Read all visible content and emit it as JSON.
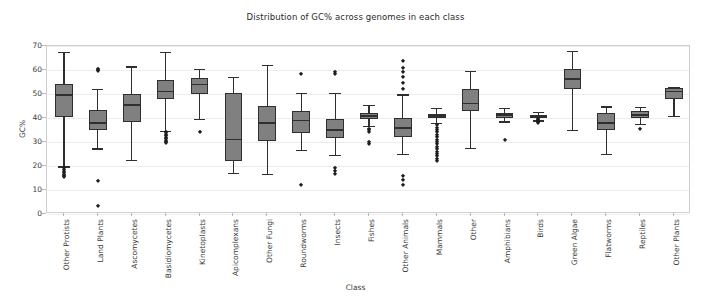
{
  "chart_data": {
    "type": "box",
    "title": "Distribution of GC% across genomes in each class",
    "xlabel": "Class",
    "ylabel": "GC%",
    "ylim": [
      0,
      70
    ],
    "yticks": [
      0,
      10,
      20,
      30,
      40,
      50,
      60,
      70
    ],
    "grid": true,
    "legend": "none",
    "box_facecolor": "#808080",
    "box_edgecolor": "#2f2f2f",
    "categories": [
      "Other Protists",
      "Land Plants",
      "Ascomycetes",
      "Basidiomycetes",
      "Kinetoplasts",
      "Apicomplexans",
      "Other Fungi",
      "Roundworms",
      "Insects",
      "Fishes",
      "Other Animals",
      "Mammals",
      "Other",
      "Amphibians",
      "Birds",
      "Green Algae",
      "Flatworms",
      "Reptiles",
      "Other Plants"
    ],
    "boxes": [
      {
        "label": "Other Protists",
        "q1": 40.5,
        "median": 49.5,
        "q3": 54.0,
        "whisker_low": 19.8,
        "whisker_high": 67.5,
        "fliers": [
          19.0,
          18.2,
          17.6,
          17.0,
          16.4,
          15.8,
          15.4
        ]
      },
      {
        "label": "Land Plants",
        "q1": 35.0,
        "median": 37.8,
        "q3": 43.2,
        "whisker_low": 27.3,
        "whisker_high": 52.2,
        "fliers": [
          60.5,
          60.0,
          59.6,
          13.6,
          3.4
        ]
      },
      {
        "label": "Ascomycetes",
        "q1": 38.5,
        "median": 45.5,
        "q3": 50.2,
        "whisker_low": 22.4,
        "whisker_high": 61.5,
        "fliers": []
      },
      {
        "label": "Basidiomycetes",
        "q1": 47.8,
        "median": 51.0,
        "q3": 56.0,
        "whisker_low": 34.5,
        "whisker_high": 67.6,
        "fliers": [
          34.2,
          33.6,
          33.0,
          32.4,
          31.8,
          31.2,
          30.6,
          30.0,
          29.5
        ]
      },
      {
        "label": "Kinetoplasts",
        "q1": 50.0,
        "median": 54.0,
        "q3": 56.6,
        "whisker_low": 39.6,
        "whisker_high": 60.4,
        "fliers": [
          34.3
        ]
      },
      {
        "label": "Apicomplexans",
        "q1": 22.2,
        "median": 31.0,
        "q3": 50.3,
        "whisker_low": 17.2,
        "whisker_high": 57.0,
        "fliers": []
      },
      {
        "label": "Other Fungi",
        "q1": 30.4,
        "median": 37.8,
        "q3": 45.2,
        "whisker_low": 16.7,
        "whisker_high": 62.0,
        "fliers": []
      },
      {
        "label": "Roundworms",
        "q1": 33.8,
        "median": 39.0,
        "q3": 42.8,
        "whisker_low": 26.6,
        "whisker_high": 50.5,
        "fliers": [
          58.3,
          12.2
        ]
      },
      {
        "label": "Insects",
        "q1": 31.8,
        "median": 35.0,
        "q3": 39.6,
        "whisker_low": 24.5,
        "whisker_high": 50.4,
        "fliers": [
          59.0,
          58.2,
          19.0,
          17.8,
          16.8
        ]
      },
      {
        "label": "Fishes",
        "q1": 39.6,
        "median": 40.8,
        "q3": 42.2,
        "whisker_low": 36.8,
        "whisker_high": 45.4,
        "fliers": [
          35.6,
          34.8,
          34.0,
          30.0,
          29.0
        ]
      },
      {
        "label": "Other Animals",
        "q1": 32.0,
        "median": 35.8,
        "q3": 40.2,
        "whisker_low": 25.0,
        "whisker_high": 49.8,
        "fliers": [
          63.6,
          61.0,
          59.0,
          57.0,
          54.5,
          52.0,
          15.8,
          14.0,
          12.2
        ]
      },
      {
        "label": "Mammals",
        "q1": 39.8,
        "median": 40.8,
        "q3": 41.8,
        "whisker_low": 38.0,
        "whisker_high": 44.2,
        "fliers": [
          37.0,
          36.0,
          35.0,
          34.0,
          33.0,
          32.0,
          31.0,
          30.0,
          29.0,
          28.0,
          27.0,
          26.0,
          25.0,
          24.0,
          23.0,
          22.0
        ]
      },
      {
        "label": "Other",
        "q1": 43.0,
        "median": 46.0,
        "q3": 52.2,
        "whisker_low": 27.5,
        "whisker_high": 59.5,
        "fliers": []
      },
      {
        "label": "Amphibians",
        "q1": 40.0,
        "median": 41.2,
        "q3": 42.2,
        "whisker_low": 38.6,
        "whisker_high": 44.3,
        "fliers": [
          31.0
        ]
      },
      {
        "label": "Birds",
        "q1": 40.0,
        "median": 40.7,
        "q3": 41.4,
        "whisker_low": 39.0,
        "whisker_high": 42.4,
        "fliers": [
          39.5,
          39.0,
          38.6,
          38.2,
          37.8
        ]
      },
      {
        "label": "Green Algae",
        "q1": 52.2,
        "median": 56.2,
        "q3": 60.6,
        "whisker_low": 35.2,
        "whisker_high": 68.0,
        "fliers": []
      },
      {
        "label": "Flatworms",
        "q1": 35.0,
        "median": 38.0,
        "q3": 42.0,
        "whisker_low": 25.2,
        "whisker_high": 44.8,
        "fliers": []
      },
      {
        "label": "Reptiles",
        "q1": 40.0,
        "median": 41.2,
        "q3": 43.0,
        "whisker_low": 37.5,
        "whisker_high": 44.6,
        "fliers": [
          35.3
        ]
      },
      {
        "label": "Other Plants",
        "q1": 48.0,
        "median": 51.0,
        "q3": 52.4,
        "whisker_low": 41.0,
        "whisker_high": 53.0,
        "fliers": []
      }
    ]
  }
}
